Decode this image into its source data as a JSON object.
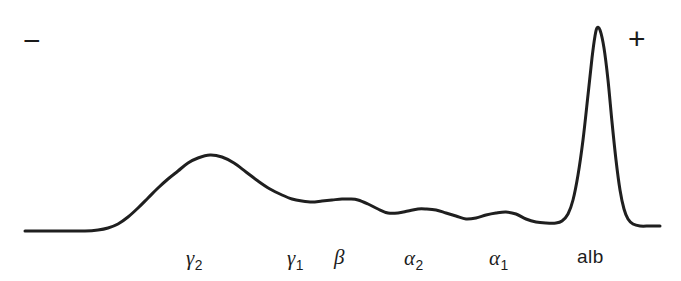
{
  "figure": {
    "kind": "serum-protein-electrophoresis-densitometry-scan",
    "background_color": "#ffffff",
    "trace_color": "#1f1f1f",
    "trace_width_px": 3.0,
    "width_px": 681,
    "height_px": 281
  },
  "polarity": {
    "negative_label": "−",
    "positive_label": "+"
  },
  "labels": [
    {
      "id": "gamma-2",
      "greek": "γ",
      "sub": "2",
      "text": "γ2",
      "x": 186,
      "y": 248,
      "style": "greek"
    },
    {
      "id": "gamma-1",
      "greek": "γ",
      "sub": "1",
      "text": "γ1",
      "x": 287,
      "y": 248,
      "style": "greek"
    },
    {
      "id": "beta",
      "greek": "β",
      "sub": "",
      "text": "β",
      "x": 334,
      "y": 247,
      "style": "greek"
    },
    {
      "id": "alpha-2",
      "greek": "α",
      "sub": "2",
      "text": "α2",
      "x": 404,
      "y": 248,
      "style": "greek"
    },
    {
      "id": "alpha-1",
      "greek": "α",
      "sub": "1",
      "text": "α1",
      "x": 489,
      "y": 248,
      "style": "greek"
    },
    {
      "id": "albumin",
      "greek": "",
      "sub": "",
      "text": "alb",
      "x": 577,
      "y": 247,
      "style": "plain"
    }
  ],
  "chart_data": {
    "type": "line",
    "title": "",
    "xlabel": "",
    "ylabel": "",
    "grid": false,
    "legend": "none",
    "axis_orientation": "migration from cathode (−, left) to anode (+, right)",
    "xlim": [
      0,
      681
    ],
    "ylim": [
      281,
      0
    ],
    "baseline_y": 231,
    "series": [
      {
        "name": "densitometry-trace",
        "color": "#1f1f1f",
        "points": [
          [
            25,
            231
          ],
          [
            45,
            231
          ],
          [
            65,
            231
          ],
          [
            85,
            231
          ],
          [
            98,
            230
          ],
          [
            108,
            228
          ],
          [
            118,
            224
          ],
          [
            128,
            217
          ],
          [
            138,
            208
          ],
          [
            148,
            198
          ],
          [
            158,
            188
          ],
          [
            168,
            179
          ],
          [
            178,
            171
          ],
          [
            188,
            163
          ],
          [
            198,
            158
          ],
          [
            210,
            155
          ],
          [
            222,
            157
          ],
          [
            234,
            163
          ],
          [
            246,
            172
          ],
          [
            258,
            181
          ],
          [
            270,
            189
          ],
          [
            282,
            195
          ],
          [
            292,
            199
          ],
          [
            302,
            201
          ],
          [
            312,
            202
          ],
          [
            322,
            201
          ],
          [
            332,
            200
          ],
          [
            342,
            199
          ],
          [
            350,
            199
          ],
          [
            358,
            200
          ],
          [
            368,
            204
          ],
          [
            378,
            209
          ],
          [
            388,
            213
          ],
          [
            398,
            213
          ],
          [
            408,
            211
          ],
          [
            418,
            209
          ],
          [
            426,
            209
          ],
          [
            436,
            210
          ],
          [
            446,
            213
          ],
          [
            456,
            216
          ],
          [
            466,
            219
          ],
          [
            476,
            218
          ],
          [
            486,
            215
          ],
          [
            496,
            213
          ],
          [
            506,
            212
          ],
          [
            516,
            214
          ],
          [
            526,
            219
          ],
          [
            536,
            222
          ],
          [
            546,
            223
          ],
          [
            556,
            223
          ],
          [
            562,
            221
          ],
          [
            568,
            214
          ],
          [
            573,
            200
          ],
          [
            578,
            175
          ],
          [
            583,
            140
          ],
          [
            588,
            95
          ],
          [
            592,
            58
          ],
          [
            595,
            36
          ],
          [
            597,
            28
          ],
          [
            600,
            30
          ],
          [
            604,
            48
          ],
          [
            608,
            80
          ],
          [
            612,
            122
          ],
          [
            616,
            160
          ],
          [
            620,
            190
          ],
          [
            624,
            209
          ],
          [
            628,
            219
          ],
          [
            633,
            224
          ],
          [
            640,
            226
          ],
          [
            650,
            226
          ],
          [
            660,
            226
          ]
        ],
        "peaks": [
          {
            "label": "γ2",
            "apex_x": 210,
            "apex_y": 155
          },
          {
            "label": "γ1",
            "apex_x": 312,
            "apex_y": 202
          },
          {
            "label": "β",
            "apex_x": 350,
            "apex_y": 199
          },
          {
            "label": "α2",
            "apex_x": 426,
            "apex_y": 209
          },
          {
            "label": "α1",
            "apex_x": 506,
            "apex_y": 212
          },
          {
            "label": "alb",
            "apex_x": 597,
            "apex_y": 28
          }
        ]
      }
    ]
  }
}
